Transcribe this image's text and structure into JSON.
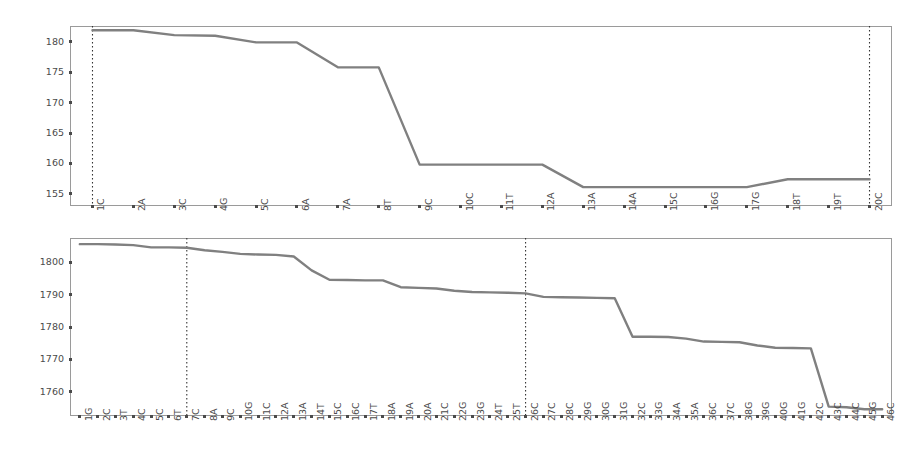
{
  "figure": {
    "background_color": "#ffffff",
    "line_color": "#808080",
    "axis_color": "#9a9a9a",
    "tick_color": "#4a4a4a",
    "marker_line_color": "#333333",
    "panel_count": 2
  },
  "chart_data": [
    {
      "type": "line",
      "id": "top-panel",
      "title": "",
      "subtitle": "",
      "xlabel": "",
      "ylabel": "",
      "grid": false,
      "legend": "none",
      "xlim": [
        0.45,
        20.55
      ],
      "ylim": [
        153.0,
        182.6
      ],
      "yticks": [
        155,
        160,
        165,
        170,
        175,
        180
      ],
      "ytick_labels": [
        "155",
        "160",
        "165",
        "170",
        "175",
        "180"
      ],
      "categories": [
        "1C",
        "2A",
        "3C",
        "4G",
        "5C",
        "6A",
        "7A",
        "8T",
        "9C",
        "10C",
        "11T",
        "12A",
        "13A",
        "14A",
        "15C",
        "16G",
        "17G",
        "18T",
        "19T",
        "20C"
      ],
      "values": [
        181.9,
        181.9,
        181.1,
        181.0,
        179.9,
        179.9,
        175.8,
        175.8,
        159.8,
        159.8,
        159.8,
        159.8,
        156.1,
        156.1,
        156.1,
        156.1,
        156.1,
        157.4,
        157.4,
        157.4
      ],
      "annotations": [
        {
          "kind": "vertical-dotted-line",
          "x_category": "1C",
          "label": "1C"
        },
        {
          "kind": "vertical-dotted-line",
          "x_category": "20C",
          "label": "20C"
        }
      ]
    },
    {
      "type": "line",
      "id": "bottom-panel",
      "title": "",
      "subtitle": "",
      "xlabel": "",
      "ylabel": "",
      "grid": false,
      "legend": "none",
      "xlim": [
        0.45,
        46.55
      ],
      "ylim": [
        1752.5,
        1807.5
      ],
      "yticks": [
        1760,
        1770,
        1780,
        1790,
        1800
      ],
      "ytick_labels": [
        "1760",
        "1770",
        "1780",
        "1790",
        "1800"
      ],
      "categories": [
        "1G",
        "2C",
        "3T",
        "4C",
        "5C",
        "6T",
        "7C",
        "8A",
        "9C",
        "10G",
        "11C",
        "12A",
        "13A",
        "14T",
        "15C",
        "16C",
        "17T",
        "18A",
        "19A",
        "20A",
        "21C",
        "22G",
        "23G",
        "24T",
        "25T",
        "26C",
        "27C",
        "28C",
        "29G",
        "30G",
        "31G",
        "32C",
        "33G",
        "34A",
        "35A",
        "36C",
        "37C",
        "38G",
        "39G",
        "40G",
        "41G",
        "42C",
        "43C",
        "44C",
        "45G",
        "46C"
      ],
      "values": [
        1805.6,
        1805.6,
        1805.5,
        1805.3,
        1804.6,
        1804.6,
        1804.5,
        1803.7,
        1803.2,
        1802.6,
        1802.4,
        1802.3,
        1801.8,
        1797.5,
        1794.6,
        1794.5,
        1794.4,
        1794.4,
        1792.3,
        1792.1,
        1791.9,
        1791.2,
        1790.8,
        1790.7,
        1790.6,
        1790.4,
        1789.3,
        1789.2,
        1789.1,
        1789.0,
        1788.9,
        1777.0,
        1777.0,
        1776.9,
        1776.4,
        1775.5,
        1775.4,
        1775.3,
        1774.3,
        1773.6,
        1773.5,
        1773.4,
        1755.4,
        1755.2,
        1754.6,
        1754.6
      ],
      "annotations": [
        {
          "kind": "vertical-dotted-line",
          "x_category": "7C",
          "label": "7C"
        },
        {
          "kind": "vertical-dotted-line",
          "x_category": "26C",
          "label": "26C"
        }
      ]
    }
  ]
}
